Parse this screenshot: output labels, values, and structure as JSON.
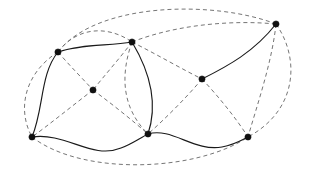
{
  "figure": {
    "background_color": "#ffffff",
    "width": 316,
    "height": 176,
    "solid_edge_color": "#1a1a1a",
    "dashed_edge_color": "#6e6e6e",
    "vertex_color": "#101010",
    "vertex_radius": 3.1
  },
  "chart_data": {
    "type": "diagram",
    "xlabel": "",
    "ylabel": "",
    "nodes": [
      {
        "id": "v1",
        "label": "",
        "x": 58,
        "y": 52,
        "degree": 5
      },
      {
        "id": "v2",
        "label": "",
        "x": 132,
        "y": 42,
        "degree": 7
      },
      {
        "id": "v3",
        "label": "",
        "x": 276,
        "y": 24,
        "degree": 5
      },
      {
        "id": "v4",
        "label": "",
        "x": 93,
        "y": 90,
        "degree": 4
      },
      {
        "id": "v5",
        "label": "",
        "x": 202,
        "y": 79,
        "degree": 4
      },
      {
        "id": "v6",
        "label": "",
        "x": 32,
        "y": 137,
        "degree": 5
      },
      {
        "id": "v7",
        "label": "",
        "x": 148,
        "y": 134,
        "degree": 6
      },
      {
        "id": "v8",
        "label": "",
        "x": 248,
        "y": 137,
        "degree": 6
      }
    ],
    "edges": [
      {
        "source": "v1",
        "target": "v2",
        "style": "solid",
        "path": "M58,52 C80,44 108,46 132,42"
      },
      {
        "source": "v1",
        "target": "v6",
        "style": "solid",
        "path": "M58,52 C40,74 44,108 32,137"
      },
      {
        "source": "v2",
        "target": "v7",
        "style": "solid",
        "path": "M132,42 C150,72 158,104 148,134"
      },
      {
        "source": "v6",
        "target": "v7",
        "style": "solid",
        "path": "M32,137 C66,132 92,160 121,148 C132,144 140,138 148,134"
      },
      {
        "source": "v7",
        "target": "v8",
        "style": "solid",
        "path": "M148,134 C172,127 194,152 222,147 C234,145 242,140 248,137"
      },
      {
        "source": "v5",
        "target": "v3",
        "style": "solid",
        "path": "M202,79 C228,66 254,52 276,24"
      },
      {
        "source": "v1",
        "target": "v2",
        "style": "dashed",
        "path": "M58,52 C76,28 106,24 132,42"
      },
      {
        "source": "v1",
        "target": "v3",
        "style": "dashed",
        "path": "M58,52 C96,2 214,0 276,24"
      },
      {
        "source": "v1",
        "target": "v4",
        "style": "dashed",
        "path": "M58,52 C70,66 82,78 93,90"
      },
      {
        "source": "v1",
        "target": "v6",
        "style": "dashed",
        "path": "M58,52 C26,72 16,108 32,137"
      },
      {
        "source": "v2",
        "target": "v3",
        "style": "dashed",
        "path": "M132,42 C178,24 234,20 276,24"
      },
      {
        "source": "v2",
        "target": "v4",
        "style": "dashed",
        "path": "M132,42 C120,58 104,76 93,90"
      },
      {
        "source": "v2",
        "target": "v5",
        "style": "dashed",
        "path": "M132,42 C156,54 180,68 202,79"
      },
      {
        "source": "v2",
        "target": "v7",
        "style": "dashed",
        "path": "M132,42 C120,76 122,108 148,134"
      },
      {
        "source": "v4",
        "target": "v6",
        "style": "dashed",
        "path": "M93,90 C72,106 50,124 32,137"
      },
      {
        "source": "v4",
        "target": "v7",
        "style": "dashed",
        "path": "M93,90 C112,104 132,120 148,134"
      },
      {
        "source": "v5",
        "target": "v7",
        "style": "dashed",
        "path": "M202,79 C186,98 166,118 148,134"
      },
      {
        "source": "v5",
        "target": "v8",
        "style": "dashed",
        "path": "M202,79 C218,96 236,118 248,137"
      },
      {
        "source": "v3",
        "target": "v8",
        "style": "dashed",
        "path": "M276,24 C300,58 298,110 248,137"
      },
      {
        "source": "v3",
        "target": "v8",
        "style": "dashed",
        "path": "M276,24 C272,62 258,102 248,137"
      },
      {
        "source": "v6",
        "target": "v8",
        "style": "dashed",
        "path": "M32,137 C82,176 196,172 248,137"
      }
    ],
    "legend": [],
    "annotations": []
  }
}
